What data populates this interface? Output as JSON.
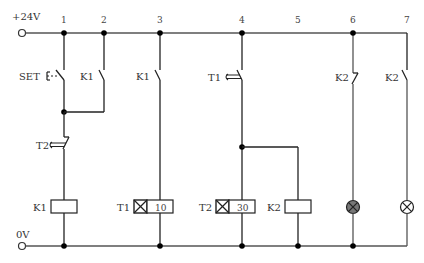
{
  "rails": {
    "top_label": "+24V",
    "bottom_label": "0V"
  },
  "columns": [
    {
      "number": "1",
      "x": 64
    },
    {
      "number": "2",
      "x": 104
    },
    {
      "number": "3",
      "x": 160
    },
    {
      "number": "4",
      "x": 242
    },
    {
      "number": "5",
      "x": 298
    },
    {
      "number": "6",
      "x": 353
    },
    {
      "number": "7",
      "x": 407
    }
  ],
  "contacts": {
    "set_button": {
      "label": "SET",
      "type": "pushbutton-NO"
    },
    "k1_hold": {
      "label": "K1",
      "type": "NO"
    },
    "t2_break": {
      "label": "T2",
      "type": "timed-NC"
    },
    "k1_col3": {
      "label": "K1",
      "type": "NO"
    },
    "t1_make": {
      "label": "T1",
      "type": "timed-NO"
    },
    "k2_col6": {
      "label": "K2",
      "type": "NC"
    },
    "k2_col7": {
      "label": "K2",
      "type": "NO"
    }
  },
  "coils": {
    "k1": {
      "label": "K1",
      "type": "relay"
    },
    "t1": {
      "label": "T1",
      "type": "timer",
      "value": "10"
    },
    "t2": {
      "label": "T2",
      "type": "timer",
      "value": "30"
    },
    "k2": {
      "label": "K2",
      "type": "relay"
    }
  },
  "lamps": [
    {
      "column": "6",
      "state": "on",
      "color": "#777777"
    },
    {
      "column": "7",
      "state": "off",
      "color": "#ffffff"
    }
  ],
  "colors": {
    "wire": "#555555",
    "node": "#000000",
    "lamp_on": "#777777"
  }
}
